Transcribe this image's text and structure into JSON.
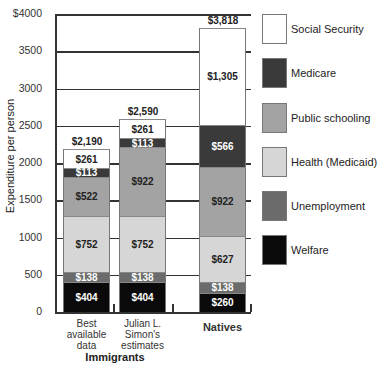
{
  "chart_data": {
    "type": "bar",
    "stacked": true,
    "title": "",
    "xlabel": "",
    "ylabel": "Expenditure per person",
    "ylim": [
      0,
      4000
    ],
    "yticks": [
      "$4000",
      "3500",
      "3000",
      "2500",
      "2000",
      "1500",
      "1000",
      "500",
      "0"
    ],
    "grid": true,
    "legend_position": "right",
    "categories": [
      "Best available data",
      "Julian L. Simon's estimates",
      "Natives"
    ],
    "category_labels": [
      [
        "Best",
        "available",
        "data"
      ],
      [
        "Julian L.",
        "Simon's",
        "estimates"
      ],
      [
        "Natives"
      ]
    ],
    "group_label": "Immigrants",
    "totals": [
      2190,
      2590,
      3818
    ],
    "total_labels": [
      "$2,190",
      "$2,590",
      "$3,818"
    ],
    "series": [
      {
        "name": "Welfare",
        "color": "#0a0a0a",
        "text_color": "#ffffff",
        "values": [
          404,
          404,
          260
        ],
        "labels": [
          "$404",
          "$404",
          "$260"
        ]
      },
      {
        "name": "Unemployment",
        "color": "#6b6b6b",
        "text_color": "#ffffff",
        "values": [
          138,
          138,
          138
        ],
        "labels": [
          "$138",
          "$138",
          "$138"
        ]
      },
      {
        "name": "Health (Medicaid)",
        "color": "#d6d6d6",
        "text_color": "#222222",
        "values": [
          752,
          752,
          627
        ],
        "labels": [
          "$752",
          "$752",
          "$627"
        ]
      },
      {
        "name": "Public schooling",
        "color": "#a3a3a3",
        "text_color": "#222222",
        "values": [
          522,
          922,
          922
        ],
        "labels": [
          "$522",
          "$922",
          "$922"
        ]
      },
      {
        "name": "Medicare",
        "color": "#3a3a3a",
        "text_color": "#ffffff",
        "values": [
          113,
          113,
          566
        ],
        "labels": [
          "$113",
          "$113",
          "$566"
        ]
      },
      {
        "name": "Social Security",
        "color": "#ffffff",
        "text_color": "#222222",
        "values": [
          261,
          261,
          1305
        ],
        "labels": [
          "$261",
          "$261",
          "$1,305"
        ]
      }
    ]
  },
  "legend": [
    {
      "label": "Social Security",
      "color": "#ffffff"
    },
    {
      "label": "Medicare",
      "color": "#3a3a3a"
    },
    {
      "label": "Public schooling",
      "color": "#a3a3a3"
    },
    {
      "label": "Health (Medicaid)",
      "color": "#d6d6d6"
    },
    {
      "label": "Unemployment",
      "color": "#6b6b6b"
    },
    {
      "label": "Welfare",
      "color": "#0a0a0a"
    }
  ]
}
